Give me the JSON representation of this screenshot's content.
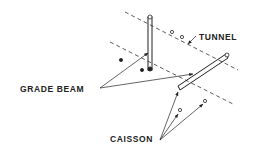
{
  "diagram": {
    "labels": {
      "tunnel": "TUNNEL",
      "grade_beam": "GRADE BEAM",
      "caisson": "CAISSON"
    },
    "colors": {
      "ink": "#222222",
      "background": "#ffffff"
    }
  }
}
